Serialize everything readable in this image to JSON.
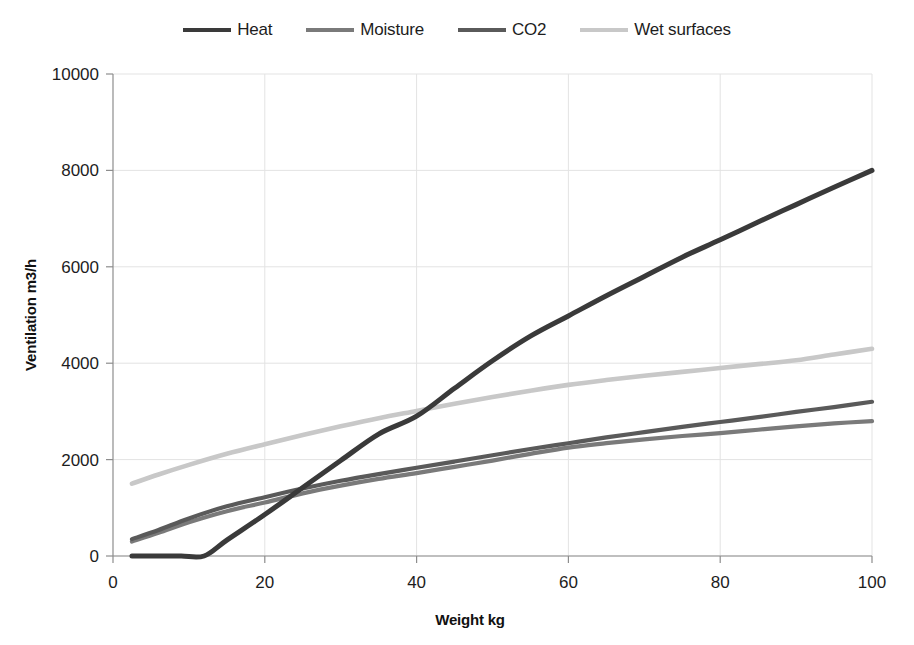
{
  "chart_data": {
    "type": "line",
    "title": "",
    "xlabel": "Weight kg",
    "ylabel": "Ventilation m3/h",
    "xlim": [
      0,
      100
    ],
    "ylim": [
      0,
      10000
    ],
    "xticks": [
      "0",
      "20",
      "40",
      "60",
      "80",
      "100"
    ],
    "yticks": [
      "0",
      "2000",
      "4000",
      "6000",
      "8000",
      "10000"
    ],
    "grid": true,
    "legend_position": "top",
    "series": [
      {
        "name": "Heat",
        "color": "#3a3a3a",
        "x": [
          2.5,
          6,
          9,
          12,
          15,
          20,
          25,
          30,
          35,
          40,
          45,
          50,
          55,
          60,
          65,
          70,
          75,
          80,
          85,
          90,
          95,
          100
        ],
        "values": [
          0,
          0,
          0,
          0,
          330,
          860,
          1420,
          1980,
          2530,
          2900,
          3480,
          4050,
          4560,
          4980,
          5400,
          5800,
          6200,
          6560,
          6930,
          7290,
          7650,
          8000
        ]
      },
      {
        "name": "Moisture",
        "color": "#7a7a7a",
        "x": [
          2.5,
          6,
          10,
          15,
          20,
          25,
          30,
          35,
          40,
          45,
          50,
          55,
          60,
          65,
          70,
          75,
          80,
          85,
          90,
          95,
          100
        ],
        "values": [
          300,
          480,
          700,
          930,
          1110,
          1300,
          1460,
          1600,
          1720,
          1850,
          1980,
          2120,
          2250,
          2340,
          2420,
          2490,
          2550,
          2620,
          2690,
          2750,
          2800
        ]
      },
      {
        "name": "CO2",
        "color": "#5a5a5a",
        "x": [
          2.5,
          6,
          10,
          15,
          20,
          25,
          30,
          35,
          40,
          45,
          50,
          55,
          60,
          65,
          70,
          75,
          80,
          85,
          90,
          95,
          100
        ],
        "values": [
          350,
          540,
          780,
          1030,
          1220,
          1400,
          1560,
          1700,
          1830,
          1960,
          2090,
          2220,
          2340,
          2460,
          2570,
          2680,
          2780,
          2880,
          2990,
          3090,
          3200
        ]
      },
      {
        "name": "Wet surfaces",
        "color": "#c8c8c8",
        "x": [
          2.5,
          6,
          10,
          15,
          20,
          25,
          30,
          35,
          40,
          45,
          50,
          55,
          60,
          65,
          70,
          75,
          80,
          85,
          90,
          95,
          100
        ],
        "values": [
          1500,
          1690,
          1890,
          2120,
          2320,
          2510,
          2690,
          2860,
          3010,
          3160,
          3300,
          3430,
          3550,
          3650,
          3740,
          3820,
          3900,
          3980,
          4060,
          4180,
          4300
        ]
      }
    ],
    "annotations": [
      "Heat remains at zero until approx 12 kg then rises steeply",
      "Heat crosses Wet surfaces near 42 kg at about 3050 m3/h",
      "Moisture and CO2 nearly overlap between 25 and 65 kg"
    ]
  },
  "legend": {
    "items": [
      {
        "label": "Heat"
      },
      {
        "label": "Moisture"
      },
      {
        "label": "CO2"
      },
      {
        "label": "Wet surfaces"
      }
    ]
  }
}
